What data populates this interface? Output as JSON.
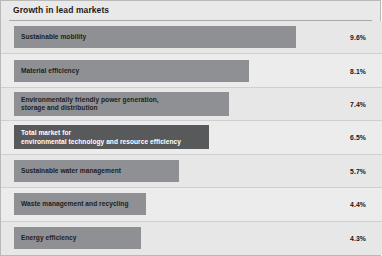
{
  "chart_data": {
    "type": "bar",
    "orientation": "horizontal",
    "title": "Growth in lead markets",
    "xlabel": "",
    "ylabel": "",
    "value_suffix": "%",
    "grid": false,
    "legend": false,
    "xlim": [
      0,
      9.6
    ],
    "categories": [
      "Sustainable mobility",
      "Material efficiency",
      "Environmentally friendly power generation, storage and distribution",
      "Total market for environmental technology and resource efficiency",
      "Sustainable water management",
      "Waste management and recycling",
      "Energy efficiency"
    ],
    "values": [
      9.6,
      8.1,
      7.4,
      6.5,
      5.7,
      4.4,
      4.3
    ],
    "value_labels": [
      "9.6%",
      "8.1%",
      "7.4%",
      "6.5%",
      "5.7%",
      "4.4%",
      "4.3%"
    ]
  },
  "colors": {
    "bar": "#8f9093",
    "bar_highlight": "#58595b",
    "panel_background": "#e9e9e9",
    "panel_border": "#b9b9b9",
    "row_divider": "#cfcfcf",
    "title_rule": "#a9a9a9",
    "text": "#1d1d1d",
    "text_on_highlight": "#ffffff"
  },
  "rows": [
    {
      "label_lines": [
        "Sustainable mobility"
      ],
      "value": "9.6%",
      "bar_width_px": 282,
      "highlight": false
    },
    {
      "label_lines": [
        "Material efficiency"
      ],
      "value": "8.1%",
      "bar_width_px": 235,
      "highlight": false
    },
    {
      "label_lines": [
        "Environmentally friendly power generation,",
        "storage and distribution"
      ],
      "value": "7.4%",
      "bar_width_px": 215,
      "highlight": false
    },
    {
      "label_lines": [
        "Total market for",
        "environmental technology and resource efficiency"
      ],
      "value": "6.5%",
      "bar_width_px": 195,
      "highlight": true
    },
    {
      "label_lines": [
        "Sustainable water management"
      ],
      "value": "5.7%",
      "bar_width_px": 165,
      "highlight": false
    },
    {
      "label_lines": [
        "Waste management and recycling"
      ],
      "value": "4.4%",
      "bar_width_px": 132,
      "highlight": false
    },
    {
      "label_lines": [
        "Energy efficiency"
      ],
      "value": "4.3%",
      "bar_width_px": 127,
      "highlight": false
    }
  ]
}
